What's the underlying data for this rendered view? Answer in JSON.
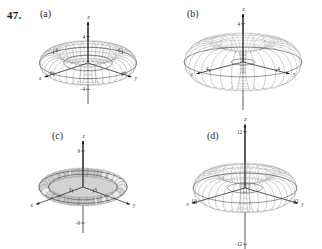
{
  "problem": {
    "number": "47."
  },
  "panels": [
    {
      "id": "a",
      "label": "(a)",
      "axes": {
        "x_label": "x",
        "y_label": "y",
        "z_label": "z",
        "z_pos_tick": "4",
        "z_neg_tick": "-4",
        "x_tick": "6",
        "y_tick": "6",
        "x_tick2": "6",
        "y_tick2": "6"
      },
      "surface": {
        "type": "torus",
        "style": "wireframe",
        "major_radius": 4.5,
        "minor_radius": 1.5,
        "u_divisions": 40,
        "v_divisions": 16
      }
    },
    {
      "id": "b",
      "label": "(b)",
      "axes": {
        "x_label": "x",
        "y_label": "y",
        "z_label": "z",
        "z_pos_tick": "4",
        "z_neg_tick": "",
        "x_tick": "4",
        "y_tick": "4"
      },
      "surface": {
        "type": "torus",
        "style": "wireframe",
        "major_radius": 3.0,
        "minor_radius": 2.0,
        "u_divisions": 32,
        "v_divisions": 16
      }
    },
    {
      "id": "c",
      "label": "(c)",
      "axes": {
        "x_label": "x",
        "y_label": "y",
        "z_label": "z",
        "z_pos_tick": "9",
        "z_neg_tick": "-9",
        "x_tick": "3",
        "y_tick": "3"
      },
      "surface": {
        "type": "torus",
        "style": "shaded-banded",
        "major_radius": 8.0,
        "minor_radius": 1.0,
        "u_divisions": 28,
        "v_divisions": 10
      }
    },
    {
      "id": "d",
      "label": "(d)",
      "axes": {
        "x_label": "x",
        "y_label": "y",
        "z_label": "z",
        "z_pos_tick": "12",
        "z_neg_tick": "-12",
        "x_tick": "12",
        "y_tick": "12"
      },
      "surface": {
        "type": "torus",
        "style": "wireframe",
        "major_radius": 6.0,
        "minor_radius": 3.0,
        "u_divisions": 36,
        "v_divisions": 16
      }
    }
  ],
  "chart_data": {
    "type": "line",
    "title": "",
    "xlabel": "x",
    "ylabel": "y"
  },
  "colors": {
    "background": "#ffffff",
    "ink": "#1a1a1a",
    "mesh": "#6e6e6e",
    "mesh_light": "#8a8a8a",
    "band_fill": "#d2d2d2"
  }
}
